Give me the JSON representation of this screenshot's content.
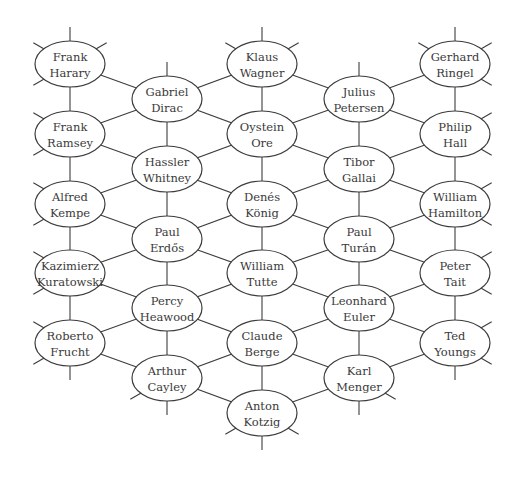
{
  "diagram": {
    "type": "hexagonal-graph",
    "ellipse": {
      "rx": 35,
      "ry": 23
    },
    "colors": {
      "stroke": "#3c3c3c",
      "text": "#3a3a3a",
      "background": "#ffffff"
    },
    "nodes": [
      {
        "id": "harary",
        "line1": "Frank",
        "line2": "Harary",
        "x": 70,
        "y": 64
      },
      {
        "id": "ramsey",
        "line1": "Frank",
        "line2": "Ramsey",
        "x": 70,
        "y": 134
      },
      {
        "id": "kempe",
        "line1": "Alfred",
        "line2": "Kempe",
        "x": 70,
        "y": 204
      },
      {
        "id": "kuratowski",
        "line1": "Kazimierz",
        "line2": "Kuratowski",
        "x": 70,
        "y": 273
      },
      {
        "id": "frucht",
        "line1": "Roberto",
        "line2": "Frucht",
        "x": 70,
        "y": 343
      },
      {
        "id": "dirac",
        "line1": "Gabriel",
        "line2": "Dirac",
        "x": 167,
        "y": 99
      },
      {
        "id": "whitney",
        "line1": "Hassler",
        "line2": "Whitney",
        "x": 167,
        "y": 169
      },
      {
        "id": "erdos",
        "line1": "Paul",
        "line2": "Erdős",
        "x": 167,
        "y": 239
      },
      {
        "id": "heawood",
        "line1": "Percy",
        "line2": "Heawood",
        "x": 167,
        "y": 308
      },
      {
        "id": "cayley",
        "line1": "Arthur",
        "line2": "Cayley",
        "x": 167,
        "y": 378
      },
      {
        "id": "wagner",
        "line1": "Klaus",
        "line2": "Wagner",
        "x": 262,
        "y": 64
      },
      {
        "id": "ore",
        "line1": "Oystein",
        "line2": "Ore",
        "x": 262,
        "y": 134
      },
      {
        "id": "konig",
        "line1": "Denés",
        "line2": "König",
        "x": 262,
        "y": 204
      },
      {
        "id": "tutte",
        "line1": "William",
        "line2": "Tutte",
        "x": 262,
        "y": 273
      },
      {
        "id": "berge",
        "line1": "Claude",
        "line2": "Berge",
        "x": 262,
        "y": 343
      },
      {
        "id": "kotzig",
        "line1": "Anton",
        "line2": "Kotzig",
        "x": 262,
        "y": 413
      },
      {
        "id": "petersen",
        "line1": "Julius",
        "line2": "Petersen",
        "x": 359,
        "y": 99
      },
      {
        "id": "gallai",
        "line1": "Tibor",
        "line2": "Gallai",
        "x": 359,
        "y": 169
      },
      {
        "id": "turan",
        "line1": "Paul",
        "line2": "Turán",
        "x": 359,
        "y": 239
      },
      {
        "id": "euler",
        "line1": "Leonhard",
        "line2": "Euler",
        "x": 359,
        "y": 308
      },
      {
        "id": "menger",
        "line1": "Karl",
        "line2": "Menger",
        "x": 359,
        "y": 378
      },
      {
        "id": "ringel",
        "line1": "Gerhard",
        "line2": "Ringel",
        "x": 455,
        "y": 64
      },
      {
        "id": "hall",
        "line1": "Philip",
        "line2": "Hall",
        "x": 455,
        "y": 134
      },
      {
        "id": "hamilton",
        "line1": "William",
        "line2": "Hamilton",
        "x": 455,
        "y": 204
      },
      {
        "id": "tait",
        "line1": "Peter",
        "line2": "Tait",
        "x": 455,
        "y": 273
      },
      {
        "id": "youngs",
        "line1": "Ted",
        "line2": "Youngs",
        "x": 455,
        "y": 343
      }
    ],
    "edges": [
      [
        "harary",
        "ramsey"
      ],
      [
        "ramsey",
        "kempe"
      ],
      [
        "kempe",
        "kuratowski"
      ],
      [
        "kuratowski",
        "frucht"
      ],
      [
        "dirac",
        "whitney"
      ],
      [
        "whitney",
        "erdos"
      ],
      [
        "erdos",
        "heawood"
      ],
      [
        "heawood",
        "cayley"
      ],
      [
        "wagner",
        "ore"
      ],
      [
        "ore",
        "konig"
      ],
      [
        "konig",
        "tutte"
      ],
      [
        "tutte",
        "berge"
      ],
      [
        "berge",
        "kotzig"
      ],
      [
        "petersen",
        "gallai"
      ],
      [
        "gallai",
        "turan"
      ],
      [
        "turan",
        "euler"
      ],
      [
        "euler",
        "menger"
      ],
      [
        "ringel",
        "hall"
      ],
      [
        "hall",
        "hamilton"
      ],
      [
        "hamilton",
        "tait"
      ],
      [
        "tait",
        "youngs"
      ],
      [
        "harary",
        "dirac"
      ],
      [
        "ramsey",
        "dirac"
      ],
      [
        "ramsey",
        "whitney"
      ],
      [
        "kempe",
        "whitney"
      ],
      [
        "kempe",
        "erdos"
      ],
      [
        "kuratowski",
        "erdos"
      ],
      [
        "kuratowski",
        "heawood"
      ],
      [
        "frucht",
        "heawood"
      ],
      [
        "frucht",
        "cayley"
      ],
      [
        "wagner",
        "dirac"
      ],
      [
        "ore",
        "dirac"
      ],
      [
        "ore",
        "whitney"
      ],
      [
        "konig",
        "whitney"
      ],
      [
        "konig",
        "erdos"
      ],
      [
        "tutte",
        "erdos"
      ],
      [
        "tutte",
        "heawood"
      ],
      [
        "berge",
        "heawood"
      ],
      [
        "berge",
        "cayley"
      ],
      [
        "kotzig",
        "cayley"
      ],
      [
        "wagner",
        "petersen"
      ],
      [
        "ore",
        "petersen"
      ],
      [
        "ore",
        "gallai"
      ],
      [
        "konig",
        "gallai"
      ],
      [
        "konig",
        "turan"
      ],
      [
        "tutte",
        "turan"
      ],
      [
        "tutte",
        "euler"
      ],
      [
        "berge",
        "euler"
      ],
      [
        "berge",
        "menger"
      ],
      [
        "kotzig",
        "menger"
      ],
      [
        "ringel",
        "petersen"
      ],
      [
        "hall",
        "petersen"
      ],
      [
        "hall",
        "gallai"
      ],
      [
        "hamilton",
        "gallai"
      ],
      [
        "hamilton",
        "turan"
      ],
      [
        "tait",
        "turan"
      ],
      [
        "tait",
        "euler"
      ],
      [
        "youngs",
        "euler"
      ],
      [
        "youngs",
        "menger"
      ]
    ],
    "stubs": [
      {
        "node": "harary",
        "dirs": [
          "up",
          "upleft",
          "downleft",
          "upright"
        ]
      },
      {
        "node": "ramsey",
        "dirs": [
          "upleft",
          "downleft"
        ]
      },
      {
        "node": "kempe",
        "dirs": [
          "upleft",
          "downleft"
        ]
      },
      {
        "node": "kuratowski",
        "dirs": [
          "upleft",
          "downleft"
        ]
      },
      {
        "node": "frucht",
        "dirs": [
          "upleft",
          "downleft",
          "down"
        ]
      },
      {
        "node": "dirac",
        "dirs": [
          "up"
        ]
      },
      {
        "node": "cayley",
        "dirs": [
          "downleft",
          "down"
        ]
      },
      {
        "node": "wagner",
        "dirs": [
          "up",
          "upleft",
          "upright"
        ]
      },
      {
        "node": "kotzig",
        "dirs": [
          "downleft",
          "downright",
          "down"
        ]
      },
      {
        "node": "petersen",
        "dirs": [
          "up"
        ]
      },
      {
        "node": "menger",
        "dirs": [
          "downright",
          "down"
        ]
      },
      {
        "node": "ringel",
        "dirs": [
          "up",
          "upleft",
          "upright",
          "downright"
        ]
      },
      {
        "node": "hall",
        "dirs": [
          "upright",
          "downright"
        ]
      },
      {
        "node": "hamilton",
        "dirs": [
          "upright",
          "downright"
        ]
      },
      {
        "node": "tait",
        "dirs": [
          "upright",
          "downright"
        ]
      },
      {
        "node": "youngs",
        "dirs": [
          "upright",
          "downright",
          "down"
        ]
      }
    ]
  }
}
